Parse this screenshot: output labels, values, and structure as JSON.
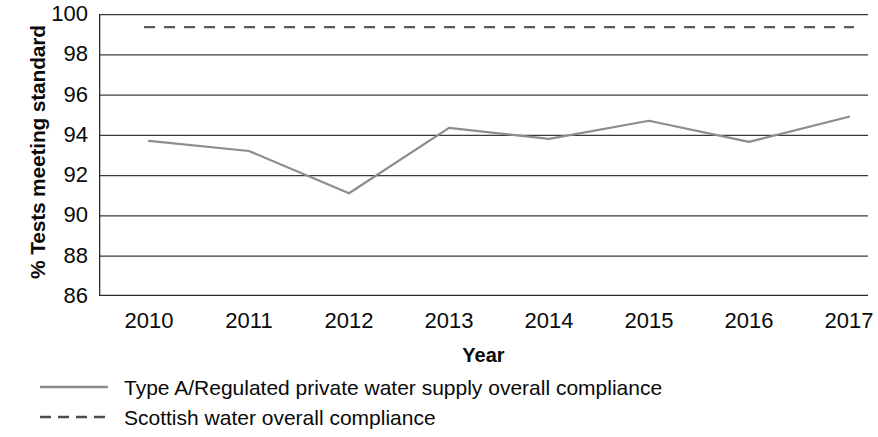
{
  "chart_data": {
    "type": "line",
    "title": "",
    "xlabel": "Year",
    "ylabel": "% Tests meeting standard",
    "x": [
      2010,
      2011,
      2012,
      2013,
      2014,
      2015,
      2016,
      2017
    ],
    "xlim": [
      2009.5,
      2017.5
    ],
    "ylim": [
      86,
      100
    ],
    "y_ticks": [
      100,
      98,
      96,
      94,
      92,
      90,
      88,
      86
    ],
    "x_tick_labels": [
      "2010",
      "2011",
      "2012",
      "2013",
      "2014",
      "2015",
      "2016",
      "2017"
    ],
    "grid": "horizontal",
    "legend_position": "below",
    "series": [
      {
        "name": "Type A/Regulated private water supply overall compliance",
        "style": "solid",
        "color": "#8c8c8c",
        "values": [
          93.7,
          93.2,
          91.1,
          94.35,
          93.8,
          94.7,
          93.65,
          94.9
        ]
      },
      {
        "name": "Scottish water overall compliance",
        "style": "dashed",
        "color": "#5a5a5a",
        "values": [
          99.35,
          99.35,
          99.35,
          99.35,
          99.35,
          99.35,
          99.35,
          99.35
        ]
      }
    ]
  },
  "axes": {
    "y_title": "% Tests meeting standard",
    "x_title": "Year",
    "y_tick_labels": [
      "100",
      "98",
      "96",
      "94",
      "92",
      "90",
      "88",
      "86"
    ],
    "x_tick_labels": [
      "2010",
      "2011",
      "2012",
      "2013",
      "2014",
      "2015",
      "2016",
      "2017"
    ]
  },
  "legend": {
    "items": [
      {
        "label": "Type A/Regulated private water supply overall compliance",
        "style": "solid",
        "color": "#8c8c8c"
      },
      {
        "label": "Scottish water overall compliance",
        "style": "dashed",
        "color": "#5a5a5a"
      }
    ]
  }
}
